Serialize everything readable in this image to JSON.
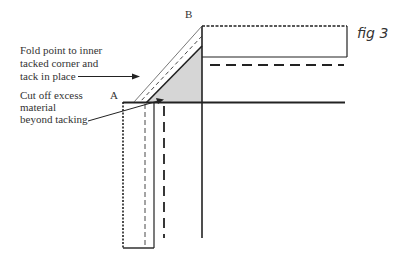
{
  "figure": {
    "title": "fig 3",
    "points": {
      "a": "A",
      "b": "B"
    },
    "annotations": [
      {
        "lines": [
          "Fold point to inner",
          "tacked corner and",
          "tack in place"
        ]
      },
      {
        "lines": [
          "Cut off excess",
          "material",
          "beyond tacking"
        ]
      }
    ],
    "colors": {
      "line": "#222222",
      "shade": "#d6d6d6"
    }
  }
}
